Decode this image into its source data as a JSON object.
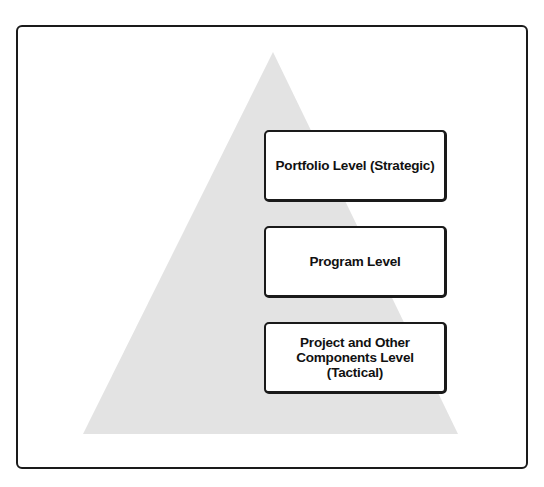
{
  "diagram": {
    "type": "pyramid",
    "colors": {
      "pyramid_fill": "#e3e3e3",
      "frame_border": "#1a1a1a",
      "box_fill": "#ffffff",
      "box_border": "#1a1a1a",
      "text": "#111111"
    },
    "levels": [
      {
        "label": "Portfolio Level (Strategic)"
      },
      {
        "label": "Program Level"
      },
      {
        "label": "Project and Other\nComponents Level\n(Tactical)"
      }
    ]
  }
}
